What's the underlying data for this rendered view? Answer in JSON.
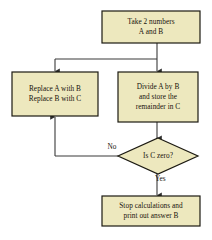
{
  "diagram": {
    "background_color": "#ffffff",
    "node_fill_color": "#ede8be",
    "node_border_color": "#1c1a12",
    "connector_color": "#3a3a3a",
    "text_color": "#17120b"
  },
  "nodes": {
    "start": {
      "shape": "process",
      "line1": "Take 2 numbers",
      "line2": "A and B"
    },
    "replace": {
      "shape": "process",
      "line1": "Replace A with B",
      "line2": "Replace B with C"
    },
    "divide": {
      "shape": "process",
      "line1": "Divide A by B",
      "line2": "and store the",
      "line3": "remainder in C"
    },
    "decision": {
      "shape": "diamond",
      "line1": "Is C zero?"
    },
    "stop": {
      "shape": "process",
      "line1": "Stop calculations and",
      "line2": "print out answer B"
    }
  },
  "edges": {
    "no_label": "No",
    "yes_label": "Yes"
  }
}
